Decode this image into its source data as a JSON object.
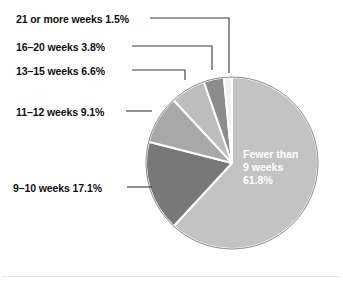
{
  "chart_data": {
    "type": "pie",
    "title": "",
    "subtitle": "",
    "xlabel": "",
    "ylabel": "",
    "legend_position": "callout-labels-left",
    "grid": false,
    "categories": [
      "Fewer than 9 weeks",
      "9–10 weeks",
      "11–12 weeks",
      "13–15 weeks",
      "16–20 weeks",
      "21 or more weeks"
    ],
    "values": [
      61.8,
      17.1,
      9.1,
      6.6,
      3.8,
      1.5
    ],
    "value_suffix": "%",
    "slice_colors": [
      "#c3c3c3",
      "#787878",
      "#a8a8a8",
      "#bdbdbd",
      "#8c8c8c",
      "#f2f2f2"
    ],
    "separator_color": "#ffffff",
    "outline_color": "#8a8a8a",
    "start_angle_deg": 0,
    "direction": "clockwise",
    "center": {
      "x": 232,
      "y": 163
    },
    "radius": 86,
    "slices": [
      {
        "label": "Fewer than 9 weeks",
        "value": 61.8,
        "display": "61.8%",
        "color": "#c3c3c3",
        "label_placement": "inside",
        "label_lines": [
          "Fewer than",
          "9 weeks",
          "61.8%"
        ]
      },
      {
        "label": "9–10 weeks",
        "value": 17.1,
        "display": "17.1%",
        "color": "#787878",
        "label_placement": "callout",
        "callout_text": "9–10 weeks 17.1%"
      },
      {
        "label": "11–12 weeks",
        "value": 9.1,
        "display": "9.1%",
        "color": "#a8a8a8",
        "label_placement": "callout",
        "callout_text": "11–12 weeks 9.1%"
      },
      {
        "label": "13–15 weeks",
        "value": 6.6,
        "display": "6.6%",
        "color": "#bdbdbd",
        "label_placement": "callout",
        "callout_text": "13–15 weeks 6.6%"
      },
      {
        "label": "16–20 weeks",
        "value": 3.8,
        "display": "3.8%",
        "color": "#8c8c8c",
        "label_placement": "callout",
        "callout_text": "16–20 weeks 3.8%"
      },
      {
        "label": "21 or more weeks",
        "value": 1.5,
        "display": "1.5%",
        "color": "#f2f2f2",
        "label_placement": "callout",
        "callout_text": "21 or more weeks 1.5%"
      }
    ]
  },
  "callouts": [
    {
      "text": "21 or more weeks 1.5%"
    },
    {
      "text": "16–20 weeks 3.8%"
    },
    {
      "text": "13–15 weeks 6.6%"
    },
    {
      "text": "11–12 weeks 9.1%"
    },
    {
      "text": "9–10 weeks 17.1%"
    }
  ],
  "inner_label": {
    "line1": "Fewer than",
    "line2": "9 weeks",
    "line3": "61.8%"
  }
}
